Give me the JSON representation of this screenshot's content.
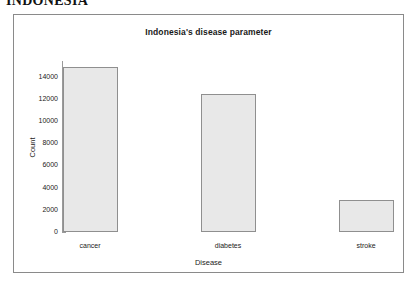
{
  "page": {
    "header": "INDONESIA"
  },
  "chart_data": {
    "type": "bar",
    "title": "Indonesia's disease parameter",
    "xlabel": "Disease",
    "ylabel": "Count",
    "categories": [
      "cancer",
      "diabetes",
      "stroke"
    ],
    "values": [
      14900,
      12400,
      2900
    ],
    "ylim": [
      0,
      15400
    ],
    "yticks": [
      0,
      2000,
      4000,
      6000,
      8000,
      10000,
      12000,
      14000
    ],
    "ytick_labels": [
      "0",
      "2000",
      "4000",
      "6000",
      "8000",
      "10000",
      "12000",
      "14000"
    ],
    "grid": false,
    "legend": null,
    "bar_fill_color": "#e8e8e8",
    "bar_border_color": "#8f8f8f",
    "axis_color": "#9a9a9a",
    "frame_color": "#8a8a8a"
  }
}
